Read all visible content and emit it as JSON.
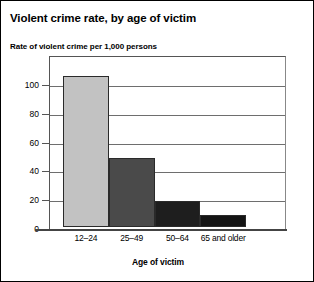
{
  "chart_data": {
    "type": "bar",
    "title": "Violent crime rate, by age of victim",
    "subtitle": "Rate of violent crime per 1,000 persons",
    "xlabel": "Age of victim",
    "ylabel": "",
    "categories": [
      "12–24",
      "25–49",
      "50–64",
      "65 and older"
    ],
    "values": [
      105,
      48,
      18,
      8
    ],
    "bar_colors": [
      "#c2c2c2",
      "#4a4a4a",
      "#1e1e1e",
      "#141414"
    ],
    "ylim": [
      0,
      120
    ],
    "yticks": [
      0,
      20,
      40,
      60,
      80,
      100
    ],
    "ytick_labels": [
      "0",
      "20",
      "40",
      "60",
      "80",
      "100"
    ],
    "grid": true,
    "legend": "none"
  }
}
